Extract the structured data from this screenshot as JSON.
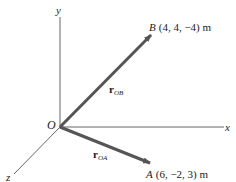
{
  "axes": {
    "x_label": "x",
    "y_label": "y",
    "z_label": "z",
    "origin_label": "O"
  },
  "points": {
    "A": {
      "name": "A",
      "coords": "(6, −2, 3) m"
    },
    "B": {
      "name": "B",
      "coords": "(4, 4, −4) m"
    }
  },
  "vectors": {
    "r_OA": {
      "symbol": "r",
      "subscript": "OA"
    },
    "r_OB": {
      "symbol": "r",
      "subscript": "OB"
    }
  },
  "colors": {
    "axis": "#555555",
    "vector": "#555555",
    "text": "#222222"
  }
}
